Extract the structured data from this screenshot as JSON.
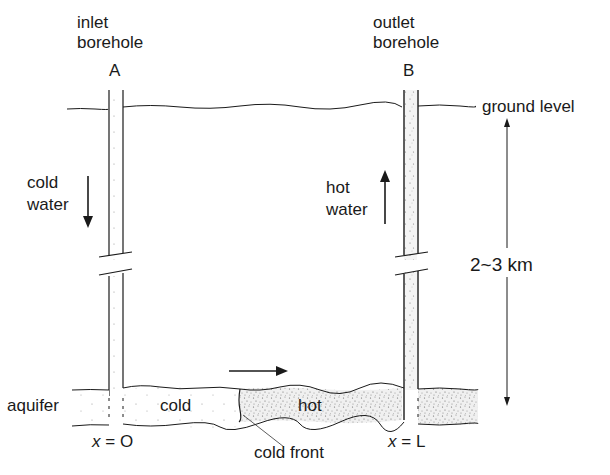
{
  "boreholes": {
    "inlet": {
      "line1": "inlet",
      "line2": "borehole",
      "letter": "A"
    },
    "outlet": {
      "line1": "outlet",
      "line2": "borehole",
      "letter": "B"
    }
  },
  "labels": {
    "ground_level": "ground level",
    "cold_water_1": "cold",
    "cold_water_2": "water",
    "hot_water_1": "hot",
    "hot_water_2": "water",
    "depth": "2~3 km",
    "aquifer": "aquifer",
    "cold_region": "cold",
    "hot_region": "hot",
    "cold_front": "cold front",
    "x0_var": "x",
    "x0_eq": "=",
    "x0_val": "O",
    "xL_var": "x",
    "xL_eq": "=",
    "xL_val": "L"
  },
  "colors": {
    "line": "#1a1a1a",
    "stipple": "#555555",
    "hot_fill": "#e8e8e8",
    "background": "#ffffff"
  }
}
